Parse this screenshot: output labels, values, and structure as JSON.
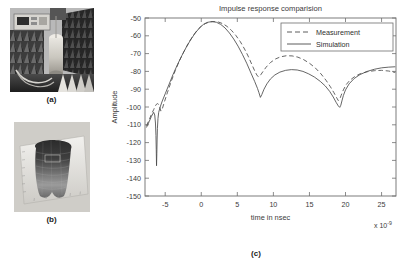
{
  "figure": {
    "panels": [
      {
        "id": "a",
        "caption": "(a)",
        "kind": "photo",
        "description": "anechoic-chamber-measurement-setup"
      },
      {
        "id": "b",
        "caption": "(b)",
        "kind": "photo",
        "description": "torso-phantom-model"
      },
      {
        "id": "c",
        "caption": "(c)",
        "kind": "chart",
        "description": "impulse-response-comparison-plot"
      }
    ]
  },
  "chart_data": {
    "type": "line",
    "title": "Impulse response comparision",
    "xlabel": "time in nsec",
    "ylabel": "Amplitude",
    "x_exponent_label": "x 10",
    "x_exponent_sup": "-9",
    "xlim": [
      -7.8,
      27.0
    ],
    "ylim": [
      -150,
      -50
    ],
    "xticks": [
      -5,
      0,
      5,
      10,
      15,
      20,
      25
    ],
    "xticklabels": [
      "-5",
      "0",
      "5",
      "10",
      "15",
      "20",
      "25"
    ],
    "yticks": [
      -150,
      -140,
      -130,
      -120,
      -110,
      -100,
      -90,
      -80,
      -70,
      -60,
      -50
    ],
    "yticklabels": [
      "-150",
      "-140",
      "-130",
      "-120",
      "-110",
      "-100",
      "-90",
      "-80",
      "-70",
      "-60",
      "-50"
    ],
    "grid": false,
    "legend_position": "upper right",
    "series": [
      {
        "name": "Measurement",
        "style": "dashed",
        "color": "#4a4a4a",
        "x": [
          -7.6,
          -7.2,
          -6.9,
          -6.6,
          -6.4,
          -6.2,
          -6.05,
          -5.9,
          -5.75,
          -5.6,
          -5.4,
          -5.1,
          -4.7,
          -4.2,
          -3.6,
          -3.0,
          -2.4,
          -1.8,
          -1.2,
          -0.6,
          0.0,
          0.6,
          1.2,
          1.8,
          2.4,
          3.0,
          3.6,
          4.2,
          4.8,
          5.4,
          6.0,
          6.5,
          7.0,
          7.4,
          7.7,
          7.9,
          8.1,
          8.3,
          8.6,
          9.0,
          9.6,
          10.3,
          11.0,
          11.8,
          12.6,
          13.4,
          14.2,
          15.0,
          15.8,
          16.6,
          17.3,
          17.9,
          18.4,
          18.8,
          19.0,
          19.2,
          19.4,
          19.7,
          20.1,
          20.6,
          21.3,
          22.1,
          23.0,
          24.0,
          25.0,
          26.0,
          26.9
        ],
        "y": [
          -110.5,
          -107.0,
          -104.0,
          -101.5,
          -99.6,
          -98.4,
          -98.1,
          -98.6,
          -100.2,
          -102.3,
          -101.0,
          -97.0,
          -92.0,
          -86.0,
          -79.5,
          -73.8,
          -68.8,
          -64.3,
          -60.4,
          -57.0,
          -54.6,
          -53.0,
          -52.2,
          -52.0,
          -52.3,
          -53.2,
          -54.8,
          -57.0,
          -59.8,
          -63.2,
          -67.4,
          -71.4,
          -76.0,
          -79.6,
          -82.0,
          -83.0,
          -82.8,
          -81.6,
          -79.8,
          -77.6,
          -75.0,
          -73.0,
          -71.8,
          -71.2,
          -71.3,
          -72.0,
          -73.4,
          -75.4,
          -78.0,
          -81.4,
          -85.0,
          -88.6,
          -92.0,
          -95.0,
          -96.4,
          -95.6,
          -93.4,
          -90.4,
          -87.4,
          -85.0,
          -82.8,
          -81.2,
          -80.2,
          -79.6,
          -79.4,
          -79.8,
          -80.6
        ]
      },
      {
        "name": "Simulation",
        "style": "solid",
        "color": "#4a4a4a",
        "x": [
          -7.6,
          -7.2,
          -6.9,
          -6.6,
          -6.45,
          -6.35,
          -6.28,
          -6.24,
          -6.2,
          -6.16,
          -6.12,
          -6.08,
          -6.0,
          -5.9,
          -5.7,
          -5.4,
          -5.0,
          -4.5,
          -3.9,
          -3.3,
          -2.7,
          -2.1,
          -1.5,
          -0.9,
          -0.3,
          0.3,
          0.9,
          1.5,
          2.1,
          2.7,
          3.3,
          3.9,
          4.5,
          5.1,
          5.7,
          6.3,
          6.9,
          7.4,
          7.8,
          8.0,
          8.2,
          8.4,
          8.7,
          9.1,
          9.6,
          10.2,
          10.9,
          11.7,
          12.5,
          13.3,
          14.1,
          14.9,
          15.7,
          16.5,
          17.2,
          17.8,
          18.3,
          18.7,
          19.0,
          19.2,
          19.35,
          19.5,
          19.7,
          20.0,
          20.5,
          21.2,
          22.0,
          23.0,
          24.0,
          25.0,
          26.0,
          26.9
        ],
        "y": [
          -111.5,
          -108.0,
          -105.2,
          -103.0,
          -104.5,
          -109.0,
          -116.0,
          -124.0,
          -133.0,
          -126.0,
          -118.0,
          -112.0,
          -106.5,
          -103.0,
          -100.0,
          -96.6,
          -92.6,
          -87.6,
          -81.6,
          -76.2,
          -71.2,
          -66.6,
          -62.4,
          -58.8,
          -55.8,
          -53.6,
          -52.4,
          -52.0,
          -52.4,
          -53.6,
          -55.6,
          -58.4,
          -61.8,
          -65.8,
          -70.4,
          -75.4,
          -81.0,
          -85.6,
          -89.6,
          -92.0,
          -94.6,
          -93.0,
          -90.0,
          -87.0,
          -84.2,
          -82.0,
          -80.4,
          -79.4,
          -79.0,
          -79.2,
          -80.0,
          -81.4,
          -83.2,
          -85.6,
          -88.2,
          -91.2,
          -94.4,
          -97.4,
          -99.4,
          -100.2,
          -99.0,
          -96.6,
          -93.6,
          -90.4,
          -87.0,
          -84.0,
          -81.8,
          -80.0,
          -78.8,
          -78.0,
          -77.6,
          -77.4
        ]
      }
    ]
  }
}
